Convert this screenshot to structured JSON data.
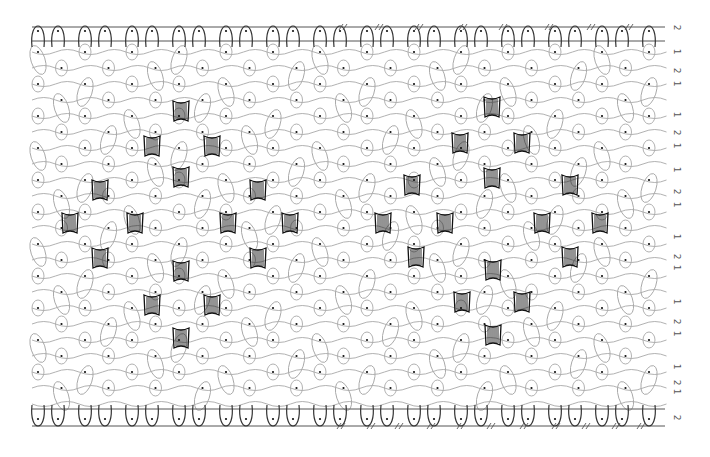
{
  "diagram": {
    "type": "bobbin-lace-pricking-diagram",
    "canvas": {
      "width": 710,
      "height": 457
    },
    "colors": {
      "background": "#ffffff",
      "thread": "#a8a8a8",
      "footside": "#333333",
      "border_line": "#555555",
      "pin": "#111111",
      "tally": "#111111",
      "label": "#555555"
    },
    "border_lines": {
      "top": [
        {
          "y": 27,
          "x1": 32,
          "x2": 665
        },
        {
          "y": 41,
          "x1": 32,
          "x2": 665
        }
      ],
      "bottom": [
        {
          "y": 409,
          "x1": 32,
          "x2": 665
        },
        {
          "y": 426,
          "x1": 32,
          "x2": 665
        }
      ],
      "left_edge_x": 32,
      "right_edge_x": 665
    },
    "grid": {
      "x0": 38,
      "dx": 47,
      "cols": 14,
      "y0": 52,
      "dy": 16,
      "rows": 23
    },
    "tallies": {
      "left_diamond": [
        [
          181,
          111
        ],
        [
          152,
          146
        ],
        [
          212,
          146
        ],
        [
          181,
          177
        ],
        [
          100,
          190
        ],
        [
          258,
          190
        ],
        [
          70,
          223
        ],
        [
          135,
          223
        ],
        [
          228,
          223
        ],
        [
          290,
          223
        ],
        [
          100,
          258
        ],
        [
          258,
          258
        ],
        [
          181,
          271
        ],
        [
          152,
          305
        ],
        [
          212,
          305
        ],
        [
          181,
          338
        ]
      ],
      "right_diamond": [
        [
          492,
          107
        ],
        [
          460,
          143
        ],
        [
          522,
          143
        ],
        [
          492,
          178
        ],
        [
          412,
          185
        ],
        [
          570,
          185
        ],
        [
          383,
          223
        ],
        [
          445,
          223
        ],
        [
          542,
          223
        ],
        [
          600,
          223
        ],
        [
          416,
          257
        ],
        [
          570,
          257
        ],
        [
          493,
          270
        ],
        [
          462,
          302
        ],
        [
          522,
          302
        ],
        [
          493,
          335
        ]
      ]
    },
    "hash_marks": {
      "top": {
        "y": 27,
        "xs": [
          342,
          378,
          418,
          462,
          502,
          548,
          590,
          628
        ]
      },
      "bottom": {
        "y": 426,
        "xs": [
          340,
          370,
          398,
          430,
          460,
          490,
          523,
          555,
          585,
          615,
          640
        ]
      }
    },
    "side_labels": [
      {
        "text": "2",
        "y": 28
      },
      {
        "text": "1",
        "y": 52
      },
      {
        "text": "2",
        "y": 71
      },
      {
        "text": "1",
        "y": 84
      },
      {
        "text": "1",
        "y": 115
      },
      {
        "text": "2",
        "y": 133
      },
      {
        "text": "1",
        "y": 146
      },
      {
        "text": "1",
        "y": 170
      },
      {
        "text": "2",
        "y": 192
      },
      {
        "text": "1",
        "y": 205
      },
      {
        "text": "1",
        "y": 237
      },
      {
        "text": "2",
        "y": 257
      },
      {
        "text": "1",
        "y": 268
      },
      {
        "text": "1",
        "y": 302
      },
      {
        "text": "2",
        "y": 322
      },
      {
        "text": "1",
        "y": 334
      },
      {
        "text": "1",
        "y": 367
      },
      {
        "text": "2",
        "y": 383
      },
      {
        "text": "1",
        "y": 392
      },
      {
        "text": "2",
        "y": 418
      }
    ],
    "side_label_x": 672
  }
}
